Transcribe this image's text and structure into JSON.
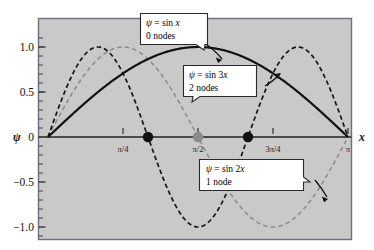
{
  "figure": {
    "title": "",
    "plot_bg_color": "#c9c9c9",
    "frame_color": "#6e6e84",
    "page_bg_color": "#ffffff"
  },
  "axes": {
    "x_axis_label": "x",
    "y_axis_label": "ψ",
    "x_ticks": [
      {
        "label": "π/4",
        "value": 0.7853981634
      },
      {
        "label": "π/2",
        "value": 1.5707963268
      },
      {
        "label": "3π/4",
        "value": 2.3561944902
      },
      {
        "label": "π",
        "value": 3.1415926536
      }
    ],
    "y_ticks": [
      {
        "label": "1.0",
        "value": 1.0
      },
      {
        "label": "0.5",
        "value": 0.5
      },
      {
        "label": "0",
        "value": 0.0
      },
      {
        "label": "−0.5",
        "value": -0.5
      },
      {
        "label": "−1.0",
        "value": -1.0
      }
    ],
    "xlim": [
      0,
      3.1415926536
    ],
    "ylim": [
      -1.12,
      1.12
    ]
  },
  "callouts": [
    {
      "id": "sin-x",
      "line1": "ψ = sin x",
      "line2": "0 nodes",
      "formula_italic_head": "ψ",
      "formula_rest": " = sin ",
      "formula_var": "x"
    },
    {
      "id": "sin-3x",
      "line1": "ψ = sin 3x",
      "line2": "2 nodes",
      "formula_italic_head": "ψ",
      "formula_rest": " = sin 3",
      "formula_var": "x"
    },
    {
      "id": "sin-2x",
      "line1": "ψ = sin 2x",
      "line2": "1 node",
      "formula_italic_head": "ψ",
      "formula_rest": " = sin 2",
      "formula_var": "x"
    }
  ],
  "nodes": [
    {
      "label": "node of sin 3x",
      "x": 1.0471975512,
      "y": 0,
      "color": "#111111"
    },
    {
      "label": "node of sin 2x",
      "x": 1.5707963268,
      "y": 0,
      "color": "#8a8a8a"
    },
    {
      "label": "node of sin 3x",
      "x": 2.0943951024,
      "y": 0,
      "color": "#111111"
    }
  ],
  "chart_data": {
    "type": "line",
    "title": "",
    "xlabel": "x",
    "ylabel": "ψ",
    "xlim": [
      0,
      3.1415926536
    ],
    "ylim": [
      -1.12,
      1.12
    ],
    "grid": false,
    "legend": "callout-annotations",
    "x_tick_labels": [
      "π/4",
      "π/2",
      "3π/4",
      "π"
    ],
    "x_tick_values": [
      0.7853981634,
      1.5707963268,
      2.3561944902,
      3.1415926536
    ],
    "y_tick_labels": [
      "1.0",
      "0.5",
      "0",
      "−0.5",
      "−1.0"
    ],
    "y_tick_values": [
      1.0,
      0.5,
      0.0,
      -0.5,
      -1.0
    ],
    "series": [
      {
        "name": "ψ = sin x",
        "nodes": 0,
        "style": "solid",
        "color": "#111111",
        "function": "sin(x)",
        "amplitude": 1.0,
        "frequency": 1,
        "maxima": [
          {
            "x": 1.5707963268,
            "y": 1.0
          }
        ],
        "minima": [],
        "zeros": [
          0.0,
          3.1415926536
        ],
        "interior_nodes": []
      },
      {
        "name": "ψ = sin 2x",
        "nodes": 1,
        "style": "dashed",
        "color": "#8a8a8a",
        "function": "sin(2x)",
        "amplitude": 1.0,
        "frequency": 2,
        "maxima": [
          {
            "x": 0.7853981634,
            "y": 1.0
          }
        ],
        "minima": [
          {
            "x": 2.3561944902,
            "y": -1.0
          }
        ],
        "zeros": [
          0.0,
          1.5707963268,
          3.1415926536
        ],
        "interior_nodes": [
          1.5707963268
        ]
      },
      {
        "name": "ψ = sin 3x",
        "nodes": 2,
        "style": "dashed",
        "color": "#111111",
        "function": "sin(3x)",
        "amplitude": 1.0,
        "frequency": 3,
        "maxima": [
          {
            "x": 0.5235987756,
            "y": 1.0
          },
          {
            "x": 2.617993878,
            "y": 1.0
          }
        ],
        "minima": [
          {
            "x": 1.5707963268,
            "y": -1.0
          }
        ],
        "zeros": [
          0.0,
          1.0471975512,
          2.0943951024,
          3.1415926536
        ],
        "interior_nodes": [
          1.0471975512,
          2.0943951024
        ]
      }
    ]
  }
}
